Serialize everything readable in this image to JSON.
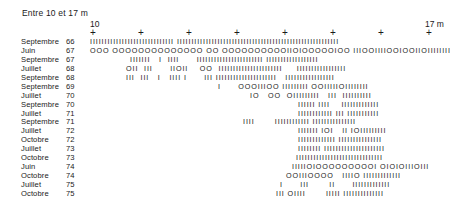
{
  "header": {
    "title": "Entre 10 et 17 m",
    "axis_start": "10",
    "axis_end": "17 m",
    "tick_glyph": "+",
    "tick_count": 8
  },
  "legend_glyphs": {
    "bar": "I",
    "circle": "O"
  },
  "rows": [
    {
      "month": "Septembre",
      "year": "66",
      "offset": 90,
      "pattern": "IIIIIIIIIIIIIIIIIIIIIIIIIIIII IIIIIIIIIIIIIIIIIIIIIIIIIIIIIIIIIIIIIIIIIIIIIIIIIIIIIIII"
    },
    {
      "month": "Juin",
      "year": "67",
      "offset": 90,
      "pattern": "OOO OOOOOOOOOOOOOO OO OOOOOOOOOOIIOIOOOOOIOO IIIOOIIIIOOIOOIIOIIIIIIII"
    },
    {
      "month": "Septembre",
      "year": "67",
      "offset": 130,
      "pattern": "IIIIIII   I  IIII      IIIIIIIIIIIIIIIIIIIIIII IIIIIIIIIIIIIIIIII"
    },
    {
      "month": "Juillet",
      "year": "68",
      "offset": 126,
      "pattern": "OII  III      IIOII    OO  IIIIIIIIIIIIIIIIIIIIII     IIIIIIIIIIIIIIIII"
    },
    {
      "month": "Septembre",
      "year": "68",
      "offset": 126,
      "pattern": "III  III   I   IIII I      III IIIIIIIIIIIIIIIIIIIII   IIIIIIIIIIIIIIIII"
    },
    {
      "month": "Septembre",
      "year": "69",
      "offset": 218,
      "pattern": "I      OOOIIIOO IIIIIIIII OOIIIIIOIIIIIIII"
    },
    {
      "month": "Juillet",
      "year": "70",
      "offset": 250,
      "pattern": "IO   OO  OIIIIIIIII   III  IIIIIIIIII"
    },
    {
      "month": "Septembre",
      "year": "70",
      "offset": 298,
      "pattern": "IIIIII IIII    IIIIIIIIIIIII"
    },
    {
      "month": "Juillet",
      "year": "71",
      "offset": 298,
      "pattern": "IIIIIIIIIIII III IIIIIIIIIII"
    },
    {
      "month": "Septembre",
      "year": "71",
      "offset": 243,
      "pattern": "IIII       IIIIIIIIIIII IIIIIIIIIIIIIII"
    },
    {
      "month": "Juillet",
      "year": "72",
      "offset": 298,
      "pattern": "IIIIIII IOI   II IOIIIIIIIII"
    },
    {
      "month": "Octobre",
      "year": "72",
      "offset": 298,
      "pattern": "IIIIIIIIIIIII IIIIIIIIIIIIIII"
    },
    {
      "month": "Juillet",
      "year": "73",
      "offset": 298,
      "pattern": "IIIIIIII IIIIIIIIIIIIIIIIIIIII"
    },
    {
      "month": "Octobre",
      "year": "73",
      "offset": 296,
      "pattern": "IIIIIIIIIIIIIIIIIIIIIIIIIIIIII"
    },
    {
      "month": "Juin",
      "year": "74",
      "offset": 292,
      "pattern": "IIIIIOIOOOOOOOOOI OIOIOIIIOIII"
    },
    {
      "month": "Octobre",
      "year": "74",
      "offset": 286,
      "pattern": "OOIIIOOOO   IIIIO IIIIIIIIIIIII"
    },
    {
      "month": "Juillet",
      "year": "75",
      "offset": 280,
      "pattern": "I      III       II      IIIIIIIIIIIII"
    },
    {
      "month": "Octobre",
      "year": "75",
      "offset": 276,
      "pattern": "III OIIII       IIIII IIIIIIIIIIIIII"
    }
  ]
}
